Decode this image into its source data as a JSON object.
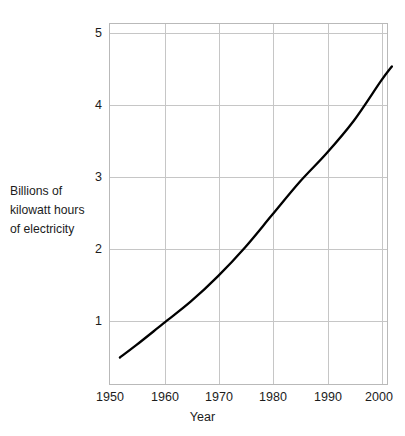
{
  "chart_data": {
    "type": "line",
    "title": "",
    "subtitle": "",
    "xlabel": "Year",
    "ylabel": "Billions of kilowatt hours of electricity",
    "ylabel_lines": [
      "Billions of",
      "kilowatt hours",
      "of electricity"
    ],
    "xlim": [
      1950,
      2002
    ],
    "ylim": [
      0,
      5
    ],
    "xticks": [
      1950,
      1960,
      1970,
      1980,
      1990,
      2000
    ],
    "xtick_labels": [
      "1950",
      "1960",
      "1970",
      "1980",
      "1990",
      "2000"
    ],
    "yticks": [
      1,
      2,
      3,
      4,
      5
    ],
    "ytick_labels": [
      "1",
      "2",
      "3",
      "4",
      "5"
    ],
    "grid": true,
    "legend": null,
    "legend_position": "none",
    "line_color": "#000000",
    "grid_color": "#c6c6c6",
    "background_color": "#ffffff",
    "series": [
      {
        "name": "Electricity consumption",
        "x": [
          1952,
          1955,
          1960,
          1965,
          1970,
          1975,
          1980,
          1985,
          1990,
          1995,
          2000,
          2002
        ],
        "values": [
          0.38,
          0.55,
          0.85,
          1.15,
          1.5,
          1.9,
          2.35,
          2.8,
          3.2,
          3.65,
          4.2,
          4.4
        ]
      }
    ],
    "annotations": []
  },
  "axes": {
    "y_axis_label_block": {
      "line1": "Billions of",
      "line2": "kilowatt hours",
      "line3": "of electricity"
    },
    "x_axis_title": "Year"
  }
}
